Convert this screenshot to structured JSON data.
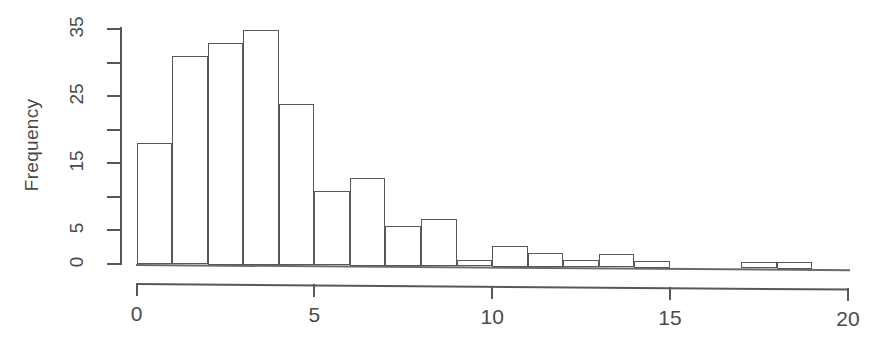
{
  "figure": {
    "ylabel": "Frequency",
    "axis_color": "#58585a",
    "text_color": "#4a4a4a",
    "bar_fill": "#ffffff",
    "bar_stroke": "#58585a"
  },
  "yaxis": {
    "ticks": [
      0,
      5,
      10,
      15,
      20,
      25,
      30,
      35
    ],
    "labeled": [
      {
        "value": 0,
        "label": "0"
      },
      {
        "value": 5,
        "label": "5"
      },
      {
        "value": 15,
        "label": "15"
      },
      {
        "value": 25,
        "label": "25"
      },
      {
        "value": 35,
        "label": "35"
      }
    ]
  },
  "xaxis": {
    "ticks": [
      {
        "value": 0,
        "label": "0"
      },
      {
        "value": 5,
        "label": "5"
      },
      {
        "value": 10,
        "label": "10"
      },
      {
        "value": 15,
        "label": "15"
      },
      {
        "value": 20,
        "label": "20"
      }
    ]
  },
  "chart_data": {
    "type": "bar",
    "title": "",
    "subtitle": "",
    "xlabel": "",
    "ylabel": "Frequency",
    "xlim": [
      0,
      20
    ],
    "ylim": [
      0,
      35
    ],
    "grid": false,
    "legend": null,
    "binwidth": 1,
    "bin_edges": [
      0,
      1,
      2,
      3,
      4,
      5,
      6,
      7,
      8,
      9,
      10,
      11,
      12,
      13,
      14,
      15,
      16,
      17,
      18,
      19
    ],
    "categories": [
      "0-1",
      "1-2",
      "2-3",
      "3-4",
      "4-5",
      "5-6",
      "6-7",
      "7-8",
      "8-9",
      "9-10",
      "10-11",
      "11-12",
      "12-13",
      "13-14",
      "14-15",
      "15-16",
      "16-17",
      "17-18",
      "18-19"
    ],
    "values": [
      18,
      31,
      33,
      35,
      24,
      11,
      13,
      6,
      7,
      1,
      3,
      2,
      1,
      2,
      1,
      0,
      0,
      1,
      1
    ],
    "ytick_values": [
      0,
      5,
      10,
      15,
      20,
      25,
      30,
      35
    ],
    "ytick_labels": [
      "0",
      "5",
      "",
      "15",
      "",
      "25",
      "",
      "35"
    ],
    "xtick_values": [
      0,
      5,
      10,
      15,
      20
    ],
    "xtick_labels": [
      "0",
      "5",
      "10",
      "15",
      "20"
    ]
  }
}
